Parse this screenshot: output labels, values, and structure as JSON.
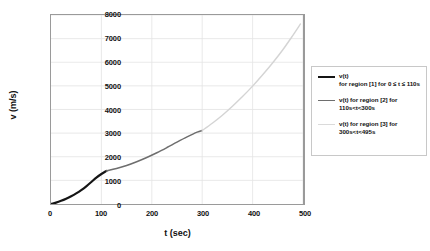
{
  "chart_data": {
    "type": "line",
    "title": "",
    "xlabel": "t (sec)",
    "ylabel": "v (m/s)",
    "xlim": [
      0,
      500
    ],
    "ylim": [
      0,
      8000
    ],
    "xticks": [
      "0",
      "100",
      "200",
      "300",
      "400",
      "500"
    ],
    "yticks": [
      "0",
      "1000",
      "2000",
      "3000",
      "4000",
      "5000",
      "6000",
      "7000",
      "8000"
    ],
    "grid": true,
    "legend_position": "right",
    "series": [
      {
        "name": "v(t) for region [1] for 0 ≤ t ≤ 110s",
        "color": "#151515",
        "x": [
          0,
          10,
          20,
          30,
          40,
          50,
          60,
          70,
          80,
          90,
          100,
          110
        ],
        "y": [
          0,
          60,
          135,
          225,
          330,
          450,
          590,
          750,
          930,
          1120,
          1270,
          1400
        ]
      },
      {
        "name": "v(t) for region [2] for 110s<t<300s",
        "color": "#6e6e6e",
        "x": [
          110,
          130,
          150,
          170,
          190,
          210,
          230,
          250,
          270,
          290,
          300
        ],
        "y": [
          1400,
          1500,
          1630,
          1790,
          1970,
          2170,
          2390,
          2620,
          2840,
          3040,
          3110
        ]
      },
      {
        "name": "v(t) for region [3] for 300s<t<495s",
        "color": "#d4d4d4",
        "x": [
          300,
          320,
          340,
          360,
          380,
          400,
          420,
          440,
          460,
          480,
          495
        ],
        "y": [
          3110,
          3420,
          3760,
          4140,
          4550,
          4990,
          5470,
          5980,
          6530,
          7140,
          7620
        ]
      }
    ]
  },
  "axes": {
    "ylabel": "v (m/s)",
    "xlabel": "t (sec)",
    "yticks": [
      {
        "value": 8000,
        "label": "8000"
      },
      {
        "value": 7000,
        "label": "7000"
      },
      {
        "value": 6000,
        "label": "6000"
      },
      {
        "value": 5000,
        "label": "5000"
      },
      {
        "value": 4000,
        "label": "4000"
      },
      {
        "value": 3000,
        "label": "3000"
      },
      {
        "value": 2000,
        "label": "2000"
      },
      {
        "value": 1000,
        "label": "1000"
      },
      {
        "value": 0,
        "label": "0"
      }
    ],
    "xticks": [
      {
        "value": 0,
        "label": "0"
      },
      {
        "value": 100,
        "label": "100"
      },
      {
        "value": 200,
        "label": "200"
      },
      {
        "value": 300,
        "label": "300"
      },
      {
        "value": 400,
        "label": "400"
      },
      {
        "value": 500,
        "label": "500"
      }
    ]
  },
  "legend": {
    "entries": [
      {
        "head": "v(t)",
        "body": "for region [1] for 0 ≤ t ≤ 110s",
        "color": "#151515",
        "width": "2.2px"
      },
      {
        "head": "",
        "body": "v(t) for region [2] for 110s<t<300s",
        "color": "#6e6e6e",
        "width": "1.6px"
      },
      {
        "head": "",
        "body": "v(t) for region [3] for 300s<t<495s",
        "color": "#dadada",
        "width": "1.4px"
      }
    ]
  }
}
